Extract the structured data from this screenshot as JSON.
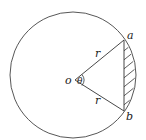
{
  "diagram": {
    "type": "circle-segment",
    "labels": {
      "center": "o",
      "angle": "θ",
      "radius_top": "r",
      "radius_bottom": "r",
      "point_a": "a",
      "point_b": "b"
    },
    "shaded_region": "circular segment between chord ab and arc ab",
    "colors": {
      "stroke": "#333333",
      "background": "#ffffff"
    }
  }
}
